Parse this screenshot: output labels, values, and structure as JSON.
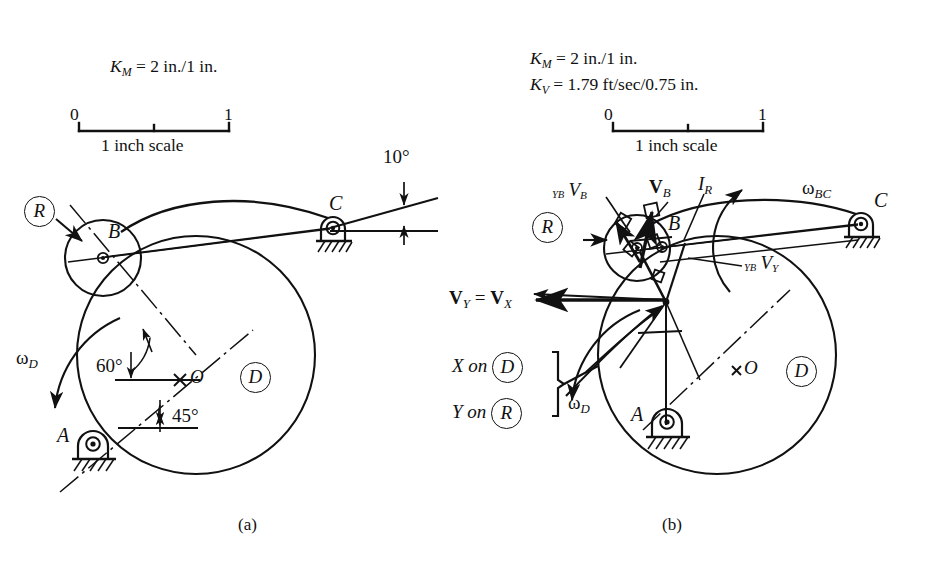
{
  "figure": {
    "kind": "kinematics-cam-follower-velocity-diagram",
    "panels": [
      {
        "id": "a",
        "caption": "(a)",
        "scale_block": {
          "lines": [
            "K_M = 2 in./1 in."
          ],
          "line1_prefix": "K",
          "line1_sub": "M",
          "line1_rest": "= 2 in./1 in.",
          "ruler_left": "0",
          "ruler_right": "1",
          "ruler_caption": "1 inch scale"
        },
        "labels": {
          "roller_R": "R",
          "point_B": "B",
          "point_C": "C",
          "point_A": "A",
          "point_O": "O",
          "cam_D": "D",
          "omega_D_base": "ω",
          "omega_D_sub": "D",
          "angle_10": "10°",
          "angle_60": "60°",
          "angle_45": "45°"
        }
      },
      {
        "id": "b",
        "caption": "(b)",
        "scale_block": {
          "line1_prefix": "K",
          "line1_sub": "M",
          "line1_rest": "= 2 in./1 in.",
          "line2_prefix": "K",
          "line2_sub": "V",
          "line2_rest": "= 1.79 ft/sec/0.75 in.",
          "ruler_left": "0",
          "ruler_right": "1",
          "ruler_caption": "1 inch scale"
        },
        "labels": {
          "roller_R": "R",
          "point_B": "B",
          "point_C": "C",
          "point_A": "A",
          "point_O": "O",
          "cam_D": "D",
          "omega_D_base": "ω",
          "omega_D_sub": "D",
          "omega_BC_base": "ω",
          "omega_BC_sub": "BC",
          "vel_YB_VB_pre": "YB",
          "vel_YB_VB_base": "V",
          "vel_YB_VB_sub": "B",
          "vel_VB_base": "V",
          "vel_VB_sub": "B",
          "vel_IR_base": "I",
          "vel_IR_sub": "R",
          "vel_YB_VY_pre": "YB",
          "vel_YB_VY_base": "V",
          "vel_YB_VY_sub": "Y",
          "vel_VY_base": "V",
          "vel_VY_sub": "Y",
          "vel_eq": "=",
          "vel_VX_base": "V",
          "vel_VX_sub": "X",
          "x_on_text": "X on",
          "x_on_body": "D",
          "y_on_text": "Y on",
          "y_on_body": "R"
        }
      }
    ],
    "colors": {
      "ink": "#111111",
      "paper": "#ffffff"
    }
  }
}
